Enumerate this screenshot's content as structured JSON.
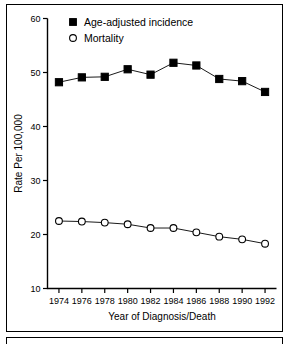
{
  "figure": {
    "background_color": "#ffffff",
    "line_color": "#000000",
    "has_border_frame": true
  },
  "chart_data": {
    "type": "line",
    "title": "",
    "subtitle": "",
    "xlabel": "Year of Diagnosis/Death",
    "ylabel": "Rate Per 100,000",
    "x": [
      1974,
      1976,
      1978,
      1980,
      1982,
      1984,
      1986,
      1988,
      1990,
      1992
    ],
    "categories": [
      "1974",
      "1976",
      "1978",
      "1980",
      "1982",
      "1984",
      "1986",
      "1988",
      "1990",
      "1992"
    ],
    "xlim": [
      1973,
      1993
    ],
    "ylim": [
      10,
      60
    ],
    "xticks": [
      1974,
      1976,
      1978,
      1980,
      1982,
      1984,
      1986,
      1988,
      1990,
      1992
    ],
    "xtick_labels": [
      "1974",
      "1976",
      "1978",
      "1980",
      "1982",
      "1984",
      "1986",
      "1988",
      "1990",
      "1992"
    ],
    "yticks": [
      10,
      20,
      30,
      40,
      50,
      60
    ],
    "ytick_labels": [
      "10",
      "20",
      "30",
      "40",
      "50",
      "60"
    ],
    "grid": false,
    "legend_position": "top-center",
    "series": [
      {
        "name": "Age-adjusted incidence",
        "marker": "filled-square",
        "color": "#000000",
        "values": [
          48.2,
          49.1,
          49.2,
          50.6,
          49.6,
          51.8,
          51.3,
          48.8,
          48.4,
          46.4
        ]
      },
      {
        "name": "Mortality",
        "marker": "open-circle",
        "color": "#000000",
        "values": [
          22.5,
          22.4,
          22.2,
          21.9,
          21.2,
          21.2,
          20.4,
          19.6,
          19.1,
          18.3
        ]
      }
    ]
  },
  "legend": {
    "entries": [
      {
        "label": "Age-adjusted incidence",
        "marker": "filled-square"
      },
      {
        "label": "Mortality",
        "marker": "open-circle"
      }
    ]
  },
  "axes": {
    "y_axis_title": "Rate Per 100,000",
    "x_axis_title": "Year of Diagnosis/Death"
  }
}
